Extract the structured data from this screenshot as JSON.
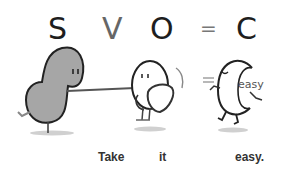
{
  "header": {
    "letters": {
      "s": "S",
      "v": "V",
      "o": "O",
      "equals": "=",
      "c": "C"
    }
  },
  "figures": {
    "subject": {
      "name": "gray bean character",
      "color": "#a6a6a6"
    },
    "object": {
      "name": "white egg character holding heart"
    },
    "complement": {
      "name": "running C character",
      "label": "easy"
    }
  },
  "caption": {
    "words": [
      "Take",
      "it",
      "easy."
    ]
  }
}
